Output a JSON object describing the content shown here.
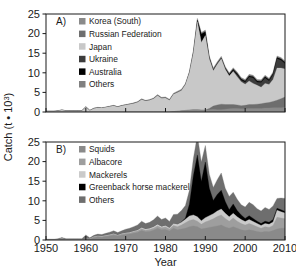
{
  "figure": {
    "ylabel": "Catch (t",
    "ylabel_mult": "• 10",
    "ylabel_exp": "3",
    "ylabel_close": ")",
    "xlabel": "Year",
    "background": "#ffffff",
    "axis_color": "#1a1a1a"
  },
  "axes": {
    "x_ticks": [
      "1950",
      "1960",
      "1970",
      "1980",
      "1990",
      "2000",
      "2010"
    ],
    "x_tick_values": [
      1950,
      1960,
      1970,
      1980,
      1990,
      2000,
      2010
    ],
    "xlim": [
      1950,
      2010
    ],
    "y_ticks": [
      "0",
      "5",
      "10",
      "15",
      "20",
      "25"
    ],
    "y_tick_values": [
      0,
      5,
      10,
      15,
      20,
      25
    ],
    "ylim": [
      0,
      25
    ],
    "grid": false
  },
  "colors": {
    "korea_south": "#8a8a8a",
    "russian_federation": "#6e6e6e",
    "japan": "#c8c8c8",
    "ukraine": "#3c3c3c",
    "australia": "#000000",
    "others_a": "#808080",
    "squids": "#8a8a8a",
    "albacore": "#9e9e9e",
    "mackerels": "#cacaca",
    "greenback": "#000000",
    "others_b": "#6e6e6e"
  },
  "panelA": {
    "label": "A)",
    "legend_position": "top-left-inset",
    "legend": [
      {
        "label": "Korea (South)",
        "color": "#8a8a8a"
      },
      {
        "label": "Russian Federation",
        "color": "#6e6e6e"
      },
      {
        "label": "Japan",
        "color": "#c8c8c8"
      },
      {
        "label": "Ukraine",
        "color": "#3c3c3c"
      },
      {
        "label": "Australia",
        "color": "#000000"
      },
      {
        "label": "Others",
        "color": "#808080"
      }
    ]
  },
  "panelB": {
    "label": "B)",
    "legend_position": "top-left-inset",
    "legend": [
      {
        "label": "Squids",
        "color": "#8a8a8a"
      },
      {
        "label": "Albacore",
        "color": "#9e9e9e"
      },
      {
        "label": "Mackerels",
        "color": "#cacaca"
      },
      {
        "label": "Greenback horse mackerel",
        "color": "#000000"
      },
      {
        "label": "Others",
        "color": "#6e6e6e"
      }
    ]
  },
  "chart_data": [
    {
      "type": "area",
      "panel": "A",
      "title": "A)",
      "stacked": true,
      "xlabel": "Year",
      "ylabel": "Catch (t • 10^3)",
      "xlim": [
        1950,
        2010
      ],
      "ylim": [
        0,
        25
      ],
      "grid": false,
      "legend": "top-left inset",
      "x": [
        1950,
        1951,
        1952,
        1953,
        1954,
        1955,
        1956,
        1957,
        1958,
        1959,
        1960,
        1961,
        1962,
        1963,
        1964,
        1965,
        1966,
        1967,
        1968,
        1969,
        1970,
        1971,
        1972,
        1973,
        1974,
        1975,
        1976,
        1977,
        1978,
        1979,
        1980,
        1981,
        1982,
        1983,
        1984,
        1985,
        1986,
        1987,
        1988,
        1989,
        1990,
        1991,
        1992,
        1993,
        1994,
        1995,
        1996,
        1997,
        1998,
        1999,
        2000,
        2001,
        2002,
        2003,
        2004,
        2005,
        2006,
        2007,
        2008,
        2009,
        2010
      ],
      "series": [
        {
          "name": "Korea (South)",
          "color": "#8a8a8a",
          "values": [
            0,
            0,
            0,
            0,
            0,
            0,
            0,
            0,
            0,
            0,
            0,
            0,
            0,
            0,
            0,
            0,
            0,
            0,
            0,
            0,
            0,
            0,
            0,
            0,
            0,
            0,
            0,
            0,
            0,
            0,
            0,
            0,
            0.1,
            0.2,
            0.3,
            0.4,
            0.5,
            0.6,
            0.6,
            0.5,
            0.5,
            0.6,
            0.7,
            0.6,
            0.6,
            0.7,
            0.8,
            0.9,
            0.9,
            0.8,
            0.8,
            0.9,
            0.9,
            0.9,
            0.9,
            1.0,
            1.0,
            1.1,
            1.1,
            1.1,
            1.2
          ]
        },
        {
          "name": "Russian Federation",
          "color": "#6e6e6e",
          "values": [
            0,
            0,
            0,
            0,
            0,
            0,
            0,
            0,
            0,
            0,
            0,
            0,
            0,
            0,
            0,
            0,
            0,
            0,
            0,
            0,
            0,
            0,
            0,
            0,
            0,
            0,
            0,
            0,
            0,
            0,
            0,
            0,
            0,
            0,
            0,
            0,
            0,
            0,
            0,
            0,
            0,
            0.3,
            0.8,
            1.2,
            1.4,
            1.2,
            1.1,
            1.0,
            0.9,
            0.8,
            0.9,
            1.0,
            1.0,
            1.1,
            1.2,
            1.3,
            1.4,
            1.6,
            1.9,
            2.3,
            2.6
          ]
        },
        {
          "name": "Japan",
          "color": "#c8c8c8",
          "values": [
            0.2,
            0.2,
            0.2,
            0.3,
            0.5,
            0.3,
            0.3,
            0.3,
            0.3,
            0.3,
            1.3,
            0.4,
            0.9,
            1.1,
            1.0,
            1.2,
            1.4,
            1.6,
            1.3,
            1.6,
            1.8,
            2.0,
            2.2,
            2.5,
            3.2,
            2.8,
            3.0,
            3.4,
            4.2,
            3.5,
            3.6,
            3.0,
            4.4,
            4.8,
            5.2,
            6.6,
            9.5,
            14.5,
            22.4,
            17.2,
            19.0,
            12.6,
            9.0,
            10.4,
            11.6,
            9.0,
            7.3,
            8.4,
            7.2,
            6.1,
            5.4,
            6.0,
            5.4,
            4.8,
            4.2,
            5.0,
            4.6,
            5.6,
            8.2,
            7.8,
            7.2
          ]
        },
        {
          "name": "Ukraine",
          "color": "#3c3c3c",
          "values": [
            0,
            0,
            0,
            0,
            0,
            0,
            0,
            0,
            0,
            0,
            0,
            0,
            0,
            0,
            0,
            0,
            0,
            0,
            0,
            0,
            0,
            0,
            0,
            0,
            0,
            0,
            0,
            0,
            0,
            0,
            0,
            0,
            0,
            0,
            0,
            0,
            0,
            0,
            0,
            0,
            0,
            0,
            0,
            0,
            0,
            0,
            0,
            0.3,
            0.5,
            0.4,
            0.5,
            1.0,
            1.4,
            0.8,
            1.2,
            1.4,
            0.9,
            1.2,
            2.4,
            2.0,
            1.3
          ]
        },
        {
          "name": "Australia",
          "color": "#000000",
          "values": [
            0,
            0,
            0,
            0,
            0,
            0,
            0,
            0,
            0,
            0,
            0,
            0,
            0,
            0,
            0,
            0,
            0,
            0,
            0,
            0,
            0,
            0,
            0,
            0,
            0,
            0,
            0,
            0,
            0,
            0,
            0,
            0,
            0,
            0,
            0,
            0,
            0,
            0.2,
            0.5,
            2.2,
            1.0,
            0.4,
            0.3,
            0.2,
            0.2,
            0.3,
            0.4,
            0.3,
            0.3,
            0.3,
            0.3,
            0.3,
            0.3,
            0.3,
            0.3,
            0.3,
            0.3,
            0.3,
            0.3,
            0.3,
            0.3
          ]
        },
        {
          "name": "Others",
          "color": "#808080",
          "values": [
            0.05,
            0.05,
            0.05,
            0.05,
            0.1,
            0.05,
            0.05,
            0.05,
            0.05,
            0.05,
            0.1,
            0.05,
            0.1,
            0.1,
            0.1,
            0.1,
            0.1,
            0.1,
            0.1,
            0.1,
            0.1,
            0.1,
            0.15,
            0.15,
            0.2,
            0.2,
            0.2,
            0.2,
            0.25,
            0.25,
            0.25,
            0.25,
            0.3,
            0.3,
            0.3,
            0.3,
            0.4,
            0.4,
            0.4,
            0.4,
            0.4,
            0.4,
            0.4,
            0.4,
            0.4,
            0.4,
            0.4,
            0.4,
            0.4,
            0.4,
            0.4,
            0.4,
            0.4,
            0.4,
            0.4,
            0.4,
            0.4,
            0.4,
            0.4,
            0.4,
            0.4
          ]
        }
      ]
    },
    {
      "type": "area",
      "panel": "B",
      "title": "B)",
      "stacked": true,
      "xlabel": "Year",
      "ylabel": "Catch (t • 10^3)",
      "xlim": [
        1950,
        2010
      ],
      "ylim": [
        0,
        25
      ],
      "grid": false,
      "legend": "top-left inset",
      "x": [
        1950,
        1951,
        1952,
        1953,
        1954,
        1955,
        1956,
        1957,
        1958,
        1959,
        1960,
        1961,
        1962,
        1963,
        1964,
        1965,
        1966,
        1967,
        1968,
        1969,
        1970,
        1971,
        1972,
        1973,
        1974,
        1975,
        1976,
        1977,
        1978,
        1979,
        1980,
        1981,
        1982,
        1983,
        1984,
        1985,
        1986,
        1987,
        1988,
        1989,
        1990,
        1991,
        1992,
        1993,
        1994,
        1995,
        1996,
        1997,
        1998,
        1999,
        2000,
        2001,
        2002,
        2003,
        2004,
        2005,
        2006,
        2007,
        2008,
        2009,
        2010
      ],
      "series": [
        {
          "name": "Squids",
          "color": "#8a8a8a",
          "values": [
            0.05,
            0.05,
            0.05,
            0.1,
            0.3,
            0.1,
            0.1,
            0.1,
            0.1,
            0.1,
            0.2,
            0.2,
            0.6,
            0.8,
            0.7,
            0.9,
            1.0,
            1.2,
            1.0,
            1.2,
            1.4,
            1.5,
            1.7,
            1.9,
            2.4,
            2.1,
            2.2,
            2.5,
            3.0,
            2.6,
            2.7,
            2.3,
            3.0,
            2.6,
            2.8,
            3.0,
            3.4,
            3.6,
            3.4,
            2.8,
            3.0,
            3.2,
            3.4,
            3.6,
            3.8,
            3.3,
            3.0,
            3.4,
            3.0,
            2.6,
            2.4,
            2.6,
            2.4,
            2.2,
            2.0,
            2.2,
            2.1,
            2.4,
            2.8,
            3.0,
            3.0
          ]
        },
        {
          "name": "Albacore",
          "color": "#9e9e9e",
          "values": [
            0.05,
            0.05,
            0.05,
            0.05,
            0.1,
            0.05,
            0.05,
            0.05,
            0.05,
            0.05,
            0.1,
            0.1,
            0.2,
            0.2,
            0.2,
            0.2,
            0.3,
            0.3,
            0.2,
            0.3,
            0.3,
            0.3,
            0.4,
            0.4,
            0.5,
            0.4,
            0.5,
            0.5,
            0.6,
            0.5,
            0.6,
            0.5,
            0.7,
            0.8,
            1.0,
            1.4,
            1.6,
            1.6,
            1.4,
            1.2,
            1.6,
            1.8,
            2.0,
            2.4,
            2.6,
            2.2,
            1.8,
            2.2,
            1.8,
            1.6,
            1.4,
            1.6,
            1.4,
            1.2,
            1.0,
            1.2,
            1.1,
            1.3,
            3.0,
            2.6,
            2.4
          ]
        },
        {
          "name": "Mackerels",
          "color": "#cacaca",
          "values": [
            0.02,
            0.02,
            0.02,
            0.02,
            0.05,
            0.02,
            0.02,
            0.02,
            0.02,
            0.02,
            0.05,
            0.05,
            0.1,
            0.1,
            0.1,
            0.1,
            0.1,
            0.15,
            0.1,
            0.15,
            0.15,
            0.2,
            0.2,
            0.25,
            0.3,
            0.3,
            0.3,
            0.35,
            0.4,
            0.35,
            0.4,
            0.35,
            0.5,
            0.6,
            0.7,
            0.9,
            1.1,
            1.2,
            1.1,
            0.9,
            1.1,
            1.2,
            1.3,
            1.4,
            1.5,
            1.3,
            1.1,
            1.2,
            1.1,
            1.0,
            0.9,
            1.0,
            0.9,
            0.8,
            0.7,
            0.8,
            0.8,
            0.9,
            1.8,
            1.6,
            1.5
          ]
        },
        {
          "name": "Greenback horse mackerel",
          "color": "#000000",
          "values": [
            0,
            0,
            0,
            0,
            0,
            0,
            0,
            0,
            0,
            0,
            0,
            0,
            0,
            0,
            0,
            0,
            0,
            0,
            0,
            0,
            0,
            0,
            0,
            0,
            0,
            0,
            0,
            0,
            0,
            0,
            0,
            0,
            0,
            0,
            0.1,
            0.3,
            3.0,
            10.0,
            15.8,
            10.0,
            14.2,
            7.0,
            3.4,
            4.2,
            4.8,
            3.0,
            1.8,
            2.4,
            1.6,
            1.2,
            0.8,
            1.0,
            0.8,
            0.6,
            0.5,
            0.6,
            0.5,
            0.6,
            0.5,
            0.5,
            0.4
          ]
        },
        {
          "name": "Others",
          "color": "#6e6e6e",
          "values": [
            0.1,
            0.1,
            0.1,
            0.15,
            0.2,
            0.15,
            0.15,
            0.15,
            0.15,
            0.15,
            0.95,
            0.2,
            0.3,
            0.4,
            0.4,
            0.5,
            0.6,
            0.7,
            0.6,
            0.7,
            0.9,
            1.0,
            1.1,
            1.3,
            1.6,
            1.4,
            1.5,
            1.8,
            2.1,
            1.8,
            1.9,
            1.6,
            2.3,
            2.6,
            2.9,
            3.2,
            3.6,
            4.4,
            5.0,
            5.0,
            4.2,
            3.6,
            3.3,
            3.8,
            4.4,
            3.4,
            3.4,
            3.0,
            2.9,
            2.6,
            2.9,
            3.4,
            3.5,
            3.2,
            3.2,
            3.5,
            3.3,
            3.5,
            2.5,
            3.0,
            3.3
          ]
        }
      ]
    }
  ]
}
